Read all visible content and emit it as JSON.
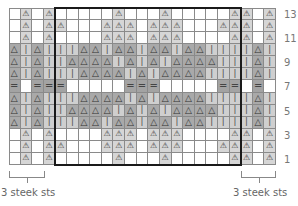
{
  "chart_data": {
    "type": "table",
    "columns": 23,
    "rows": 13,
    "legend": {
      "A": "light gray cell with triangle-dot motif",
      "T": "dark gray cell with triangle",
      "I": "light gray cell with vertical bar",
      "E": "dark gray cell with double bar (=)",
      ".": "white cell"
    },
    "row_labels": [
      "13",
      "11",
      "9",
      "7",
      "5",
      "3",
      "1"
    ],
    "grid_top_to_bottom": [
      ".A.A.....A...A.....AA.A",
      ".A.AA...AAA.AAA...AAA.A",
      ".A.A....AAA.AAA....AA.A",
      "TITIIITTITTITTITTIIIITI",
      "TITIITTTTITITITTTTIIITI",
      "TITIIITTTTITTITTTTIIIITI",
      "E.EEE.....EEE.....EE.E.",
      "TITIIITTTTITTITTTTIIIITI",
      "TITIITTTTITITITTTTIIITI",
      "TITIIITTITTITTITTIIIITI",
      ".A.A....AAA.AAA....AA.A",
      ".A.AA...AAA.AAA...AAA.A",
      ".A.A.....A...A.....AA.A"
    ],
    "pattern_repeat_box": {
      "first_col": 5,
      "last_col": 20,
      "first_row": 1,
      "last_row": 13
    },
    "annotations": [
      "3 steek sts",
      "3 steek sts"
    ]
  },
  "grid": [
    [
      ".",
      "A",
      ".",
      "A",
      ".",
      ".",
      ".",
      ".",
      ".",
      "A",
      ".",
      ".",
      ".",
      "A",
      ".",
      ".",
      ".",
      ".",
      ".",
      "A",
      "A",
      ".",
      "A"
    ],
    [
      ".",
      "A",
      ".",
      "A",
      "A",
      ".",
      ".",
      ".",
      "A",
      "A",
      "A",
      ".",
      "A",
      "A",
      "A",
      ".",
      ".",
      ".",
      "A",
      "A",
      "A",
      ".",
      "A"
    ],
    [
      ".",
      "A",
      ".",
      "A",
      ".",
      ".",
      ".",
      ".",
      "A",
      "A",
      "A",
      ".",
      "A",
      "A",
      "A",
      ".",
      ".",
      ".",
      ".",
      "A",
      "A",
      ".",
      "A"
    ],
    [
      "T",
      "I",
      "T",
      "I",
      "I",
      "I",
      "T",
      "T",
      "I",
      "T",
      "T",
      "I",
      "T",
      "T",
      "I",
      "T",
      "T",
      "I",
      "I",
      "I",
      "I",
      "T",
      "I"
    ],
    [
      "T",
      "I",
      "T",
      "I",
      "I",
      "T",
      "T",
      "T",
      "T",
      "I",
      "T",
      "I",
      "T",
      "I",
      "T",
      "T",
      "T",
      "T",
      "I",
      "I",
      "I",
      "T",
      "I"
    ],
    [
      "T",
      "I",
      "T",
      "I",
      "I",
      "I",
      "T",
      "T",
      "T",
      "T",
      "I",
      "T",
      "I",
      "T",
      "T",
      "T",
      "T",
      "I",
      "I",
      "I",
      "I",
      "T",
      "I"
    ],
    [
      "E",
      ".",
      "E",
      "E",
      "E",
      ".",
      ".",
      ".",
      ".",
      ".",
      "E",
      "E",
      "E",
      ".",
      ".",
      ".",
      ".",
      ".",
      "E",
      "E",
      ".",
      "E",
      "."
    ],
    [
      "T",
      "I",
      "T",
      "I",
      "I",
      "I",
      "T",
      "T",
      "T",
      "T",
      "I",
      "T",
      "I",
      "T",
      "T",
      "T",
      "T",
      "I",
      "I",
      "I",
      "I",
      "T",
      "I"
    ],
    [
      "T",
      "I",
      "T",
      "I",
      "I",
      "T",
      "T",
      "T",
      "T",
      "I",
      "T",
      "I",
      "T",
      "I",
      "T",
      "T",
      "T",
      "T",
      "I",
      "I",
      "I",
      "T",
      "I"
    ],
    [
      "T",
      "I",
      "T",
      "I",
      "I",
      "I",
      "T",
      "T",
      "I",
      "T",
      "T",
      "I",
      "T",
      "T",
      "I",
      "T",
      "T",
      "I",
      "I",
      "I",
      "I",
      "T",
      "I"
    ],
    [
      ".",
      "A",
      ".",
      "A",
      ".",
      ".",
      ".",
      ".",
      "A",
      "A",
      "A",
      ".",
      "A",
      "A",
      "A",
      ".",
      ".",
      ".",
      ".",
      "A",
      "A",
      ".",
      "A"
    ],
    [
      ".",
      "A",
      ".",
      "A",
      "A",
      ".",
      ".",
      ".",
      "A",
      "A",
      "A",
      ".",
      "A",
      "A",
      "A",
      ".",
      ".",
      ".",
      "A",
      "A",
      "A",
      ".",
      "A"
    ],
    [
      ".",
      "A",
      ".",
      "A",
      ".",
      ".",
      ".",
      ".",
      ".",
      "A",
      ".",
      ".",
      ".",
      "A",
      ".",
      ".",
      ".",
      ".",
      ".",
      "A",
      "A",
      ".",
      "A"
    ]
  ],
  "symbols": {
    "A": "⚠",
    "T": "△",
    "I": "ǀ",
    "E": "=",
    ".": ""
  },
  "row_numbers": [
    {
      "label": "13",
      "row_index": 0
    },
    {
      "label": "11",
      "row_index": 2
    },
    {
      "label": "9",
      "row_index": 4
    },
    {
      "label": "7",
      "row_index": 6
    },
    {
      "label": "5",
      "row_index": 8
    },
    {
      "label": "3",
      "row_index": 10
    },
    {
      "label": "1",
      "row_index": 12
    }
  ],
  "steek": {
    "left_label": "3 steek sts",
    "right_label": "3 steek sts"
  }
}
